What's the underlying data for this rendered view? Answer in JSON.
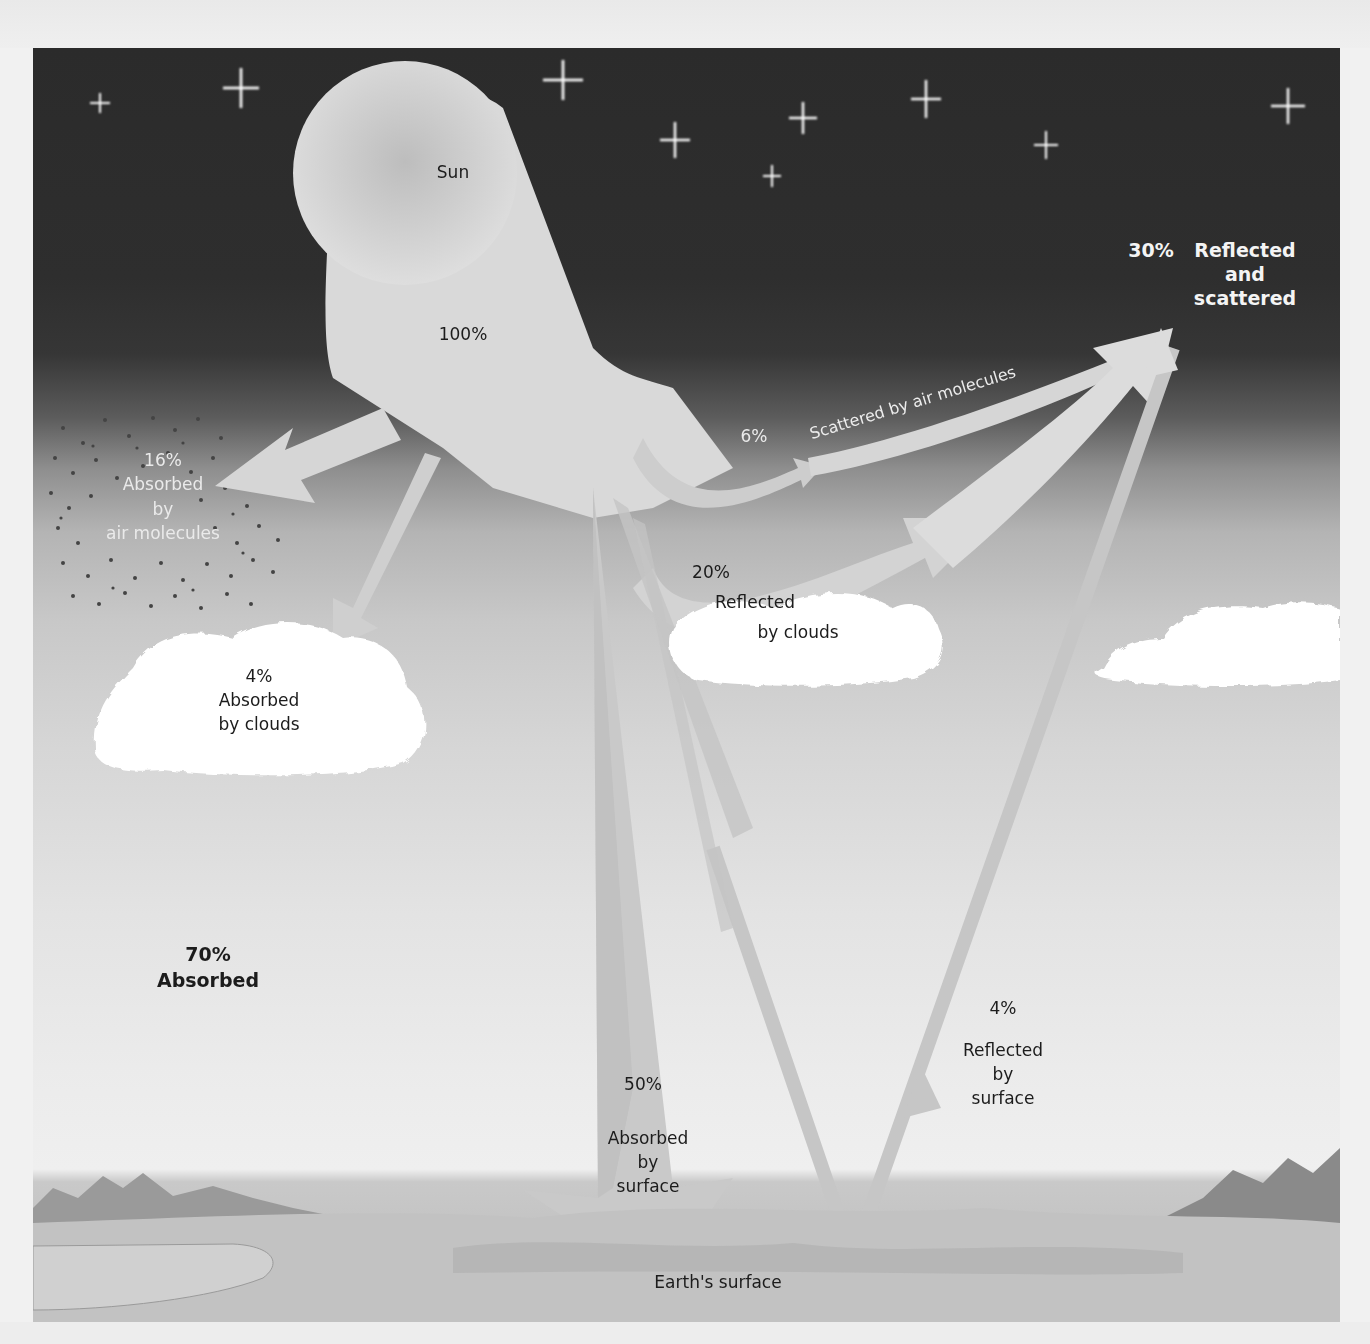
{
  "figure": {
    "colors": {
      "space": "#2b2b2b",
      "beam": "#d9d9d9",
      "arrow_shadow": "#bdbdbd",
      "cloud": "#ffffff",
      "ground": "#b8b8b8",
      "text_dark": "#1c1c1c",
      "text_light": "#f4f4f4"
    },
    "nodes": {
      "sun": {
        "label": "Sun"
      },
      "incoming": {
        "percent": "100%"
      },
      "reflected_total": {
        "percent": "30%",
        "line1": "Reflected",
        "line2": "and",
        "line3": "scattered"
      },
      "scattered_air": {
        "percent": "6%",
        "label": "Scattered by air molecules"
      },
      "absorbed_air": {
        "percent": "16%",
        "line1": "Absorbed",
        "line2": "by",
        "line3": "air molecules"
      },
      "reflected_clouds": {
        "percent": "20%",
        "line1": "Reflected",
        "line2": "by clouds"
      },
      "absorbed_clouds": {
        "percent": "4%",
        "line1": "Absorbed",
        "line2": "by clouds"
      },
      "absorbed_total": {
        "percent": "70%",
        "label": "Absorbed"
      },
      "absorbed_surface": {
        "percent": "50%",
        "line1": "Absorbed",
        "line2": "by",
        "line3": "surface"
      },
      "reflected_surface": {
        "percent": "4%",
        "line1": "Reflected",
        "line2": "by",
        "line3": "surface"
      },
      "earth": {
        "label": "Earth's surface"
      }
    },
    "flows": [
      {
        "from": "Sun",
        "to": "Atmosphere",
        "value": 100
      },
      {
        "from": "Atmosphere",
        "to": "Space",
        "label": "Scattered by air molecules",
        "value": 6
      },
      {
        "from": "Clouds",
        "to": "Space",
        "label": "Reflected by clouds",
        "value": 20
      },
      {
        "from": "Surface",
        "to": "Space",
        "label": "Reflected by surface",
        "value": 4
      },
      {
        "from": "Atmosphere",
        "to": "Air molecules",
        "label": "Absorbed by air molecules",
        "value": 16
      },
      {
        "from": "Atmosphere",
        "to": "Clouds",
        "label": "Absorbed by clouds",
        "value": 4
      },
      {
        "from": "Atmosphere",
        "to": "Surface",
        "label": "Absorbed by surface",
        "value": 50
      }
    ],
    "totals": {
      "reflected_and_scattered": 30,
      "absorbed": 70
    }
  }
}
